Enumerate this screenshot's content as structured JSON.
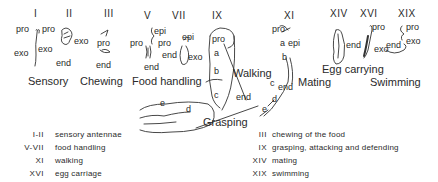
{
  "appendages": [
    {
      "numeral": "I",
      "labels": [
        "pro",
        "exo"
      ]
    },
    {
      "numeral": "II",
      "labels": [
        "pro",
        "exo",
        "exo",
        "end"
      ]
    },
    {
      "numeral": "III",
      "labels": [
        "pro",
        "end"
      ]
    },
    {
      "numeral": "V",
      "labels": [
        "pro",
        "epi",
        "end"
      ]
    },
    {
      "numeral": "VII",
      "labels": [
        "pro",
        "epi",
        "end",
        "exo"
      ]
    },
    {
      "numeral": "IX",
      "labels": [
        "pro",
        "a",
        "b",
        "c",
        "d",
        "e",
        "end"
      ]
    },
    {
      "numeral": "XI",
      "labels": [
        "pro",
        "a",
        "epi",
        "b",
        "c",
        "d",
        "e",
        "end"
      ]
    },
    {
      "numeral": "XIV",
      "labels": []
    },
    {
      "numeral": "XVI",
      "labels": [
        "pro",
        "end",
        "exo"
      ]
    },
    {
      "numeral": "XIX",
      "labels": [
        "pro",
        "end",
        "exo"
      ]
    }
  ],
  "part_labels": {
    "pro": "pro",
    "exo": "exo",
    "end": "end",
    "epi": "epi",
    "a": "a",
    "b": "b",
    "c": "c",
    "d": "d",
    "e": "e"
  },
  "functions": {
    "sensory": "Sensory",
    "chewing": "Chewing",
    "food_handling": "Food handling",
    "grasping": "Grasping",
    "walking": "Walking",
    "mating": "Mating",
    "egg_carrying": "Egg carrying",
    "swimming": "Swimming"
  },
  "legend": {
    "left": [
      {
        "range": "I-II",
        "text": "sensory antennae"
      },
      {
        "range": "V-VII",
        "text": "food handling"
      },
      {
        "range": "XI",
        "text": "walking"
      },
      {
        "range": "XVI",
        "text": "egg carriage"
      }
    ],
    "right": [
      {
        "range": "III",
        "text": "chewing of the food"
      },
      {
        "range": "IX",
        "text": "grasping, attacking and defending"
      },
      {
        "range": "XIV",
        "text": "mating"
      },
      {
        "range": "XIX",
        "text": "swimming"
      }
    ]
  },
  "colors": {
    "ink": "#2a2a2a",
    "background": "#ffffff"
  }
}
